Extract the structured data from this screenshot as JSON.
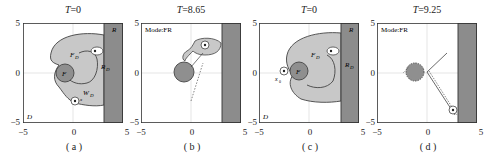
{
  "figure": {
    "panels": [
      {
        "id": "a",
        "title_var": "T",
        "title_value": "=0",
        "caption": "( a )",
        "mode_label": "",
        "labels": {
          "R": "R",
          "FD": "F",
          "FD_sub": "D",
          "RD": "R",
          "RD_sub": "D",
          "WD": "W",
          "WD_sub": "D",
          "F": "F",
          "D": "D",
          "x": "x"
        }
      },
      {
        "id": "b",
        "title_var": "T",
        "title_value": "=8.65",
        "caption": "( b )",
        "mode_label": "Mode:FR"
      },
      {
        "id": "c",
        "title_var": "T",
        "title_value": "=0",
        "caption": "( c )",
        "mode_label": "",
        "labels": {
          "R": "R",
          "FD": "F",
          "FD_sub": "D",
          "RD": "R",
          "RD_sub": "D",
          "F": "F",
          "D": "D",
          "x0": "x",
          "x0_sub": "0"
        }
      },
      {
        "id": "d",
        "title_var": "T",
        "title_value": "=9.25",
        "caption": "( d )",
        "mode_label": "Mode:FR"
      }
    ],
    "axes": {
      "xticks": [
        "−5",
        "0",
        "5"
      ],
      "yticks": [
        "5",
        "0",
        "−5"
      ],
      "xlim": [
        -5,
        5
      ],
      "ylim": [
        -5,
        5
      ]
    },
    "colors": {
      "frame": "#333333",
      "region_R": "#8c8c8c",
      "region_FD": "#c8c8c8",
      "obstacle_F": "#8f8f8f",
      "grid": "#cccccc",
      "background": "#ffffff"
    }
  }
}
